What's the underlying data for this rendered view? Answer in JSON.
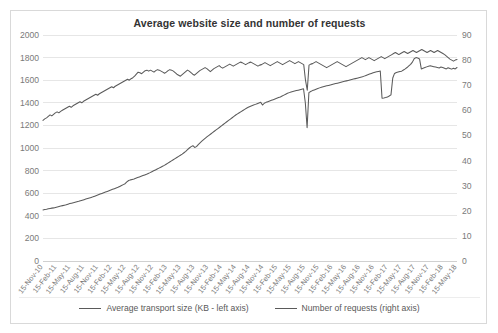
{
  "chart_data": {
    "type": "line",
    "title": "Average website size and number of requests",
    "xlabel": "",
    "ylabel": "",
    "grid": true,
    "legend_position": "bottom",
    "x_tick_labels": [
      "15-Nov-10",
      "15-Feb-11",
      "15-May-11",
      "15-Aug-11",
      "15-Nov-11",
      "15-Feb-12",
      "15-May-12",
      "15-Aug-12",
      "15-Nov-12",
      "15-Feb-13",
      "15-May-13",
      "15-Aug-13",
      "15-Nov-13",
      "15-Feb-14",
      "15-May-14",
      "15-Aug-14",
      "15-Nov-14",
      "15-Feb-15",
      "15-May-15",
      "15-Aug-15",
      "15-Nov-15",
      "15-Feb-16",
      "15-May-16",
      "15-Aug-16",
      "15-Nov-16",
      "15-Feb-17",
      "15-May-17",
      "15-Aug-17",
      "15-Nov-17",
      "15-Feb-18",
      "15-May-18"
    ],
    "left_axis": {
      "label": "Average transport size (KB - left axis)",
      "ylim": [
        0,
        2000
      ],
      "ticks": [
        0,
        200,
        400,
        600,
        800,
        1000,
        1200,
        1400,
        1600,
        1800,
        2000
      ]
    },
    "right_axis": {
      "label": "Number of requests (right axis)",
      "ylim": [
        0,
        90
      ],
      "ticks": [
        0,
        10,
        20,
        30,
        40,
        50,
        60,
        70,
        80,
        90
      ]
    },
    "series": [
      {
        "name": "Average transport size (KB - left axis)",
        "axis": "left",
        "color": "#5a5a5a",
        "values": [
          452,
          455,
          458,
          462,
          465,
          468,
          470,
          474,
          478,
          482,
          486,
          490,
          494,
          498,
          503,
          508,
          512,
          516,
          520,
          524,
          528,
          533,
          538,
          543,
          548,
          553,
          558,
          563,
          568,
          574,
          580,
          586,
          592,
          598,
          604,
          610,
          616,
          622,
          628,
          634,
          640,
          646,
          652,
          660,
          668,
          676,
          684,
          700,
          712,
          718,
          722,
          726,
          732,
          738,
          744,
          750,
          756,
          762,
          768,
          775,
          782,
          790,
          798,
          806,
          814,
          822,
          830,
          838,
          846,
          856,
          866,
          876,
          886,
          896,
          906,
          916,
          926,
          936,
          946,
          958,
          970,
          985,
          1000,
          1012,
          1020,
          1005,
          1012,
          1030,
          1046,
          1060,
          1074,
          1088,
          1100,
          1112,
          1124,
          1136,
          1148,
          1160,
          1172,
          1184,
          1196,
          1208,
          1220,
          1232,
          1244,
          1256,
          1268,
          1280,
          1292,
          1302,
          1312,
          1322,
          1332,
          1342,
          1352,
          1360,
          1368,
          1374,
          1380,
          1386,
          1392,
          1398,
          1404,
          1380,
          1396,
          1404,
          1410,
          1416,
          1422,
          1428,
          1434,
          1440,
          1446,
          1452,
          1460,
          1468,
          1476,
          1484,
          1490,
          1496,
          1500,
          1504,
          1508,
          1512,
          1516,
          1520,
          1524,
          1400,
          1180,
          1490,
          1500,
          1508,
          1514,
          1520,
          1526,
          1532,
          1538,
          1542,
          1546,
          1550,
          1554,
          1558,
          1562,
          1566,
          1570,
          1574,
          1578,
          1582,
          1586,
          1590,
          1594,
          1598,
          1602,
          1606,
          1610,
          1614,
          1618,
          1622,
          1626,
          1630,
          1636,
          1642,
          1648,
          1654,
          1660,
          1666,
          1670,
          1674,
          1678,
          1682,
          1440,
          1442,
          1446,
          1452,
          1460,
          1470,
          1620,
          1660,
          1668,
          1672,
          1676,
          1680,
          1690,
          1700,
          1712,
          1726,
          1740,
          1760,
          1790,
          1800,
          1796,
          1788,
          1700,
          1706,
          1712,
          1718,
          1724,
          1728,
          1724,
          1720,
          1716,
          1712,
          1708,
          1716,
          1712,
          1706,
          1700,
          1710,
          1704,
          1698,
          1706,
          1700,
          1712
        ]
      },
      {
        "name": "Number of requests (right axis)",
        "axis": "right",
        "color": "#5a5a5a",
        "values": [
          56.0,
          56.6,
          57.0,
          57.6,
          58.2,
          57.8,
          58.4,
          59.0,
          59.4,
          59.0,
          59.6,
          60.0,
          60.4,
          60.8,
          61.2,
          61.6,
          61.2,
          61.8,
          62.2,
          62.6,
          63.0,
          63.4,
          63.0,
          63.6,
          64.0,
          64.4,
          64.8,
          65.2,
          65.6,
          66.0,
          66.4,
          66.0,
          66.6,
          67.0,
          67.4,
          67.8,
          68.2,
          68.6,
          69.0,
          69.4,
          69.0,
          69.6,
          70.0,
          70.4,
          70.8,
          71.2,
          71.6,
          72.0,
          72.4,
          72.0,
          72.6,
          73.0,
          73.6,
          74.4,
          75.2,
          75.0,
          74.6,
          75.2,
          75.8,
          76.0,
          75.6,
          76.0,
          75.6,
          75.2,
          75.8,
          76.2,
          76.0,
          75.6,
          75.2,
          74.8,
          75.2,
          75.8,
          76.2,
          76.0,
          75.6,
          75.0,
          74.4,
          74.0,
          73.6,
          74.2,
          74.8,
          75.4,
          76.0,
          75.6,
          75.0,
          74.4,
          74.0,
          74.6,
          75.2,
          75.8,
          76.2,
          76.6,
          77.0,
          76.6,
          76.0,
          75.4,
          76.0,
          76.6,
          77.0,
          77.4,
          77.8,
          77.2,
          76.8,
          77.2,
          77.6,
          78.0,
          78.4,
          78.0,
          77.6,
          78.0,
          78.4,
          78.8,
          79.2,
          79.0,
          78.6,
          78.2,
          78.6,
          79.0,
          79.2,
          78.8,
          78.4,
          78.0,
          77.6,
          78.0,
          78.2,
          78.6,
          79.0,
          78.6,
          78.2,
          77.8,
          78.2,
          78.6,
          79.0,
          79.4,
          79.0,
          78.6,
          78.2,
          78.6,
          79.0,
          79.4,
          79.8,
          79.4,
          79.0,
          78.6,
          79.0,
          79.4,
          79.0,
          78.6,
          78.2,
          72.0,
          68.0,
          78.0,
          78.4,
          78.6,
          79.0,
          79.4,
          79.0,
          78.6,
          78.2,
          77.8,
          77.4,
          77.0,
          77.4,
          77.8,
          78.2,
          78.6,
          79.0,
          79.4,
          79.0,
          78.6,
          78.2,
          77.8,
          77.4,
          77.8,
          78.2,
          78.6,
          79.0,
          79.4,
          79.8,
          80.2,
          80.6,
          81.0,
          80.6,
          80.2,
          80.6,
          81.0,
          80.6,
          80.2,
          79.8,
          80.2,
          80.6,
          81.0,
          81.4,
          81.0,
          80.6,
          81.0,
          81.4,
          81.8,
          82.2,
          82.6,
          83.0,
          82.6,
          82.2,
          82.6,
          83.0,
          83.4,
          83.0,
          82.6,
          83.0,
          83.4,
          83.8,
          83.4,
          83.0,
          83.4,
          83.8,
          84.2,
          83.8,
          83.4,
          83.0,
          83.4,
          83.8,
          83.4,
          83.0,
          83.4,
          83.8,
          83.4,
          83.0,
          82.6,
          82.2,
          81.6,
          81.0,
          80.4,
          80.0,
          79.6,
          80.0,
          80.2
        ]
      }
    ]
  }
}
